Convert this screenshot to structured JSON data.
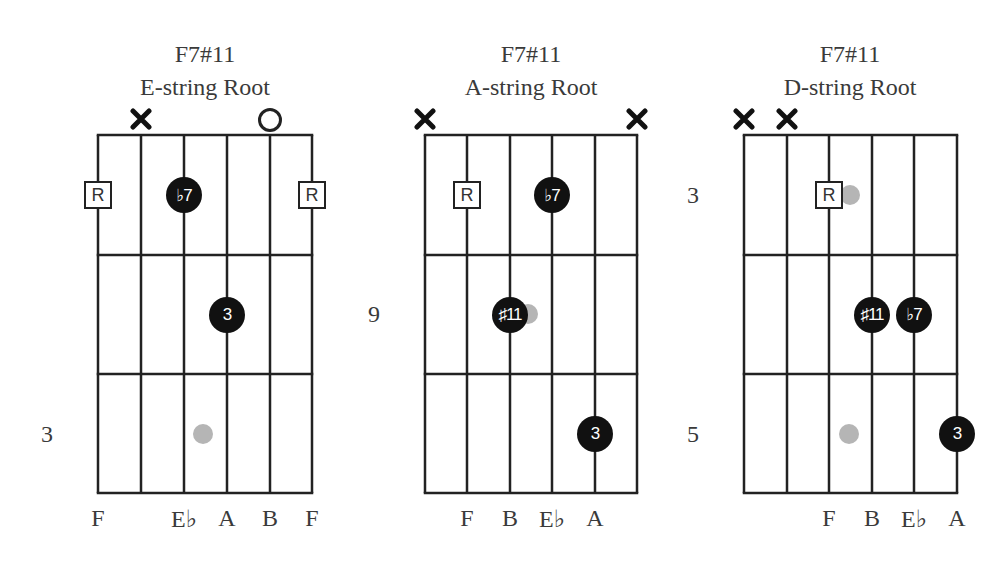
{
  "diagrams": [
    {
      "title": "F7#11",
      "subtitle": "E-string Root",
      "center_x": 205,
      "strings_x": [
        98,
        141,
        184,
        227,
        270,
        312
      ],
      "frets_y": [
        135,
        255,
        374,
        493
      ],
      "fret_number": {
        "label": "3",
        "x": 47,
        "y": 434
      },
      "string_markers": [
        {
          "type": "mute",
          "string": 1
        },
        {
          "type": "open",
          "string": 4
        }
      ],
      "notes": [
        {
          "type": "root",
          "label": "R",
          "string": 0,
          "fret": 0
        },
        {
          "type": "dot",
          "label": "♭7",
          "string": 2,
          "fret": 0
        },
        {
          "type": "root",
          "label": "R",
          "string": 5,
          "fret": 0
        },
        {
          "type": "dot",
          "label": "3",
          "string": 3,
          "fret": 1
        },
        {
          "type": "ghost",
          "x": 203,
          "y": 434
        }
      ],
      "note_names": [
        {
          "label": "F",
          "string": 0
        },
        {
          "label": "E♭",
          "string": 2
        },
        {
          "label": "A",
          "string": 3
        },
        {
          "label": "B",
          "string": 4
        },
        {
          "label": "F",
          "string": 5
        }
      ]
    },
    {
      "title": "F7#11",
      "subtitle": "A-string Root",
      "center_x": 531,
      "strings_x": [
        425,
        467,
        510,
        552,
        595,
        637
      ],
      "frets_y": [
        135,
        255,
        374,
        493
      ],
      "fret_number": {
        "label": "9",
        "x": 374,
        "y": 314
      },
      "string_markers": [
        {
          "type": "mute",
          "string": 0
        },
        {
          "type": "mute",
          "string": 5
        }
      ],
      "notes": [
        {
          "type": "root",
          "label": "R",
          "string": 1,
          "fret": 0
        },
        {
          "type": "dot",
          "label": "♭7",
          "string": 3,
          "fret": 0
        },
        {
          "type": "ghost",
          "x": 528,
          "y": 314
        },
        {
          "type": "dot",
          "label": "♯11",
          "string": 2,
          "fret": 1
        },
        {
          "type": "dot",
          "label": "3",
          "string": 4,
          "fret": 2
        }
      ],
      "note_names": [
        {
          "label": "F",
          "string": 1
        },
        {
          "label": "B",
          "string": 2
        },
        {
          "label": "E♭",
          "string": 3
        },
        {
          "label": "A",
          "string": 4
        }
      ]
    },
    {
      "title": "F7#11",
      "subtitle": "D-string Root",
      "center_x": 850,
      "strings_x": [
        744,
        787,
        829,
        872,
        914,
        957
      ],
      "frets_y": [
        135,
        255,
        374,
        493
      ],
      "fret_numbers": [
        {
          "label": "3",
          "x": 693,
          "y": 195
        },
        {
          "label": "5",
          "x": 693,
          "y": 434
        }
      ],
      "string_markers": [
        {
          "type": "mute",
          "string": 0
        },
        {
          "type": "mute",
          "string": 1
        }
      ],
      "notes": [
        {
          "type": "ghost",
          "x": 850,
          "y": 195
        },
        {
          "type": "root",
          "label": "R",
          "string": 2,
          "fret": 0
        },
        {
          "type": "dot",
          "label": "♯11",
          "string": 3,
          "fret": 1
        },
        {
          "type": "dot",
          "label": "♭7",
          "string": 4,
          "fret": 1
        },
        {
          "type": "ghost",
          "x": 849,
          "y": 434
        },
        {
          "type": "dot",
          "label": "3",
          "string": 5,
          "fret": 2
        }
      ],
      "note_names": [
        {
          "label": "F",
          "string": 2
        },
        {
          "label": "B",
          "string": 3
        },
        {
          "label": "E♭",
          "string": 4
        },
        {
          "label": "A",
          "string": 5
        }
      ]
    }
  ],
  "colors": {
    "line": "#222222",
    "dot": "#111111",
    "ghost": "#b5b5b5",
    "text": "#3a3a3a"
  }
}
